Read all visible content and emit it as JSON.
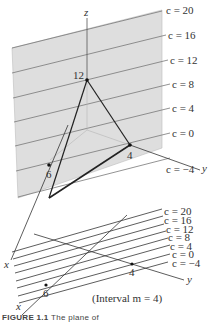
{
  "figure": {
    "top_panel": {
      "axis_labels": {
        "x": "x",
        "y": "y",
        "z": "z"
      },
      "intercepts": [
        {
          "axis": "z",
          "label": "12"
        },
        {
          "axis": "y",
          "label": "4"
        },
        {
          "axis": "x",
          "label": "6"
        }
      ],
      "level_lines": [
        {
          "label": "c = 20"
        },
        {
          "label": "c = 16"
        },
        {
          "label": "c = 12"
        },
        {
          "label": "c = 8"
        },
        {
          "label": "c = 4"
        },
        {
          "label": "c = 0"
        },
        {
          "label": "c = −4"
        }
      ],
      "plane_color": "#dcdcdc"
    },
    "bottom_panel": {
      "axis_labels": {
        "x": "x",
        "y": "y"
      },
      "intercepts": [
        {
          "axis": "y",
          "label": "4"
        },
        {
          "axis": "x",
          "label": "6"
        }
      ],
      "level_lines": [
        {
          "label": "c = 20"
        },
        {
          "label": "c = 16"
        },
        {
          "label": "c = 12"
        },
        {
          "label": "c = 8"
        },
        {
          "label": "c = 4"
        },
        {
          "label": "c = 0"
        },
        {
          "label": "c = −4"
        }
      ],
      "interval_note": "(Interval m = 4)"
    },
    "caption": {
      "number": "FIGURE 1.1",
      "text": "The plane of"
    }
  }
}
